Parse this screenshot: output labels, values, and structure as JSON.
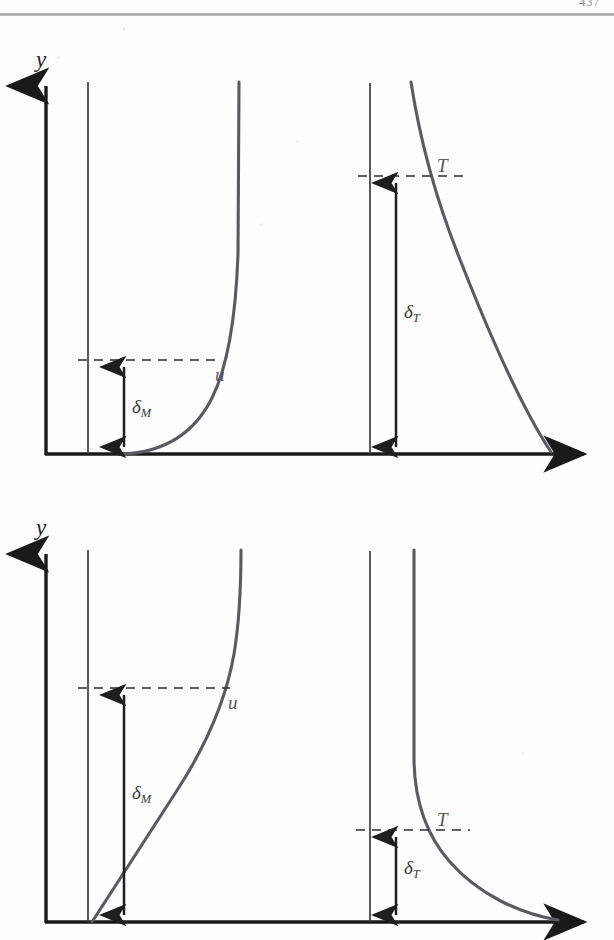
{
  "page": {
    "folio": "437",
    "background_color": "#fefefe",
    "rule_color": "#9a9a9a"
  },
  "labels": {
    "y_axis": "y",
    "velocity_curve": "u",
    "temperature_curve": "T",
    "delta_symbol": "δ",
    "momentum_subscript": "M",
    "thermal_subscript": "T"
  },
  "colors": {
    "axis": "#1a1a1a",
    "reference_line": "#3d3d3d",
    "profile_curve": "#5a5a62",
    "dashed_line": "#2e2e2e",
    "dimension_arrow": "#1f1f1f"
  },
  "figures": [
    {
      "name": "thin-momentum-thick-thermal",
      "panels": [
        {
          "name": "velocity-profile-panel",
          "quantity": "u",
          "boundary_layer": "δ",
          "boundary_subscript": "M",
          "relative_thickness": "thin"
        },
        {
          "name": "temperature-profile-panel",
          "quantity": "T",
          "boundary_layer": "δ",
          "boundary_subscript": "T",
          "relative_thickness": "thick"
        }
      ]
    },
    {
      "name": "thick-momentum-thin-thermal",
      "panels": [
        {
          "name": "velocity-profile-panel",
          "quantity": "u",
          "boundary_layer": "δ",
          "boundary_subscript": "M",
          "relative_thickness": "thick"
        },
        {
          "name": "temperature-profile-panel",
          "quantity": "T",
          "boundary_layer": "δ",
          "boundary_subscript": "T",
          "relative_thickness": "thin"
        }
      ]
    }
  ],
  "geometry": {
    "figure_one": {
      "origin_x": 46,
      "baseline_y": 454,
      "axis_top_y": 78,
      "axis_right_x": 597,
      "u_reference_x": 88,
      "u_reference_top_y": 82,
      "u_delta_arrow_x": 124,
      "u_dash_y": 360,
      "u_dash_x1": 78,
      "u_dash_x2": 217,
      "t_reference_x": 370,
      "t_reference_top_y": 83,
      "t_delta_arrow_x": 396,
      "t_dash_y": 176,
      "t_dash_x1": 358,
      "t_dash_x2": 470
    },
    "figure_two": {
      "origin_x": 46,
      "baseline_y": 922,
      "axis_top_y": 545,
      "axis_right_x": 597,
      "u_reference_x": 88,
      "u_reference_top_y": 550,
      "u_delta_arrow_x": 124,
      "u_dash_y": 688,
      "u_dash_x1": 78,
      "u_dash_x2": 230,
      "t_reference_x": 370,
      "t_reference_top_y": 551,
      "t_delta_arrow_x": 396,
      "t_dash_y": 830,
      "t_dash_x1": 356,
      "t_dash_x2": 470
    }
  }
}
